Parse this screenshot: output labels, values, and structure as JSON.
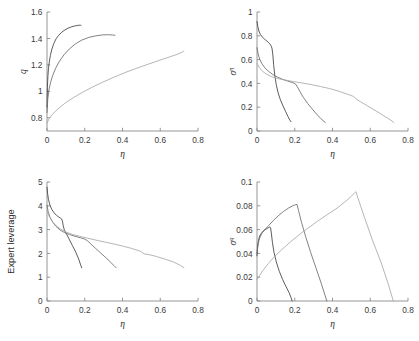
{
  "figure": {
    "background": "#ffffff",
    "panel_count": 4,
    "shared_xlabel": "η"
  },
  "axis": {
    "color": "#8a8a8a",
    "tick_font_size": "8.3px"
  },
  "series_colors": [
    "#3f3f3f",
    "#6b6b6b",
    "#a8a8a8"
  ],
  "chart_data": [
    {
      "id": "panel-tl",
      "type": "line",
      "title": "",
      "xlabel": "η",
      "ylabel": "q",
      "ylabel_sup": "",
      "xlim": [
        0,
        0.8
      ],
      "ylim": [
        0.7,
        1.6
      ],
      "xticks": [
        0,
        0.2,
        0.4,
        0.6,
        0.8
      ],
      "xticklabels": [
        "0",
        "0.2",
        "0.4",
        "0.6",
        "0.8"
      ],
      "yticks": [
        0.8,
        1,
        1.2,
        1.4,
        1.6
      ],
      "yticklabels": [
        "0.8",
        "1",
        "1.2",
        "1.4",
        "1.6"
      ],
      "grid": false,
      "legend": "none",
      "series": [
        {
          "name": "curve-1",
          "color": "#3f3f3f",
          "x": [
            0.0,
            0.002,
            0.005,
            0.008,
            0.012,
            0.018,
            0.026,
            0.036,
            0.048,
            0.062,
            0.078,
            0.095,
            0.112,
            0.13,
            0.146,
            0.16,
            0.17,
            0.176,
            0.18
          ],
          "y": [
            0.88,
            1.03,
            1.12,
            1.175,
            1.222,
            1.272,
            1.32,
            1.362,
            1.397,
            1.424,
            1.447,
            1.464,
            1.478,
            1.488,
            1.494,
            1.498,
            1.5,
            1.5,
            1.499
          ]
        },
        {
          "name": "curve-2",
          "color": "#6b6b6b",
          "x": [
            0.0,
            0.004,
            0.01,
            0.018,
            0.03,
            0.046,
            0.066,
            0.09,
            0.118,
            0.15,
            0.185,
            0.222,
            0.26,
            0.296,
            0.326,
            0.348,
            0.36
          ],
          "y": [
            0.84,
            0.94,
            1.01,
            1.062,
            1.12,
            1.175,
            1.228,
            1.276,
            1.32,
            1.358,
            1.388,
            1.408,
            1.42,
            1.427,
            1.428,
            1.426,
            1.424
          ]
        },
        {
          "name": "curve-3",
          "color": "#a8a8a8",
          "x": [
            0.0,
            0.01,
            0.025,
            0.045,
            0.07,
            0.1,
            0.14,
            0.185,
            0.235,
            0.29,
            0.35,
            0.41,
            0.47,
            0.53,
            0.59,
            0.645,
            0.69,
            0.715,
            0.725
          ],
          "y": [
            0.758,
            0.79,
            0.82,
            0.85,
            0.882,
            0.915,
            0.952,
            0.99,
            1.028,
            1.066,
            1.104,
            1.14,
            1.172,
            1.202,
            1.232,
            1.258,
            1.28,
            1.295,
            1.305
          ]
        }
      ]
    },
    {
      "id": "panel-tr",
      "type": "line",
      "title": "",
      "xlabel": "η",
      "ylabel": "σ",
      "ylabel_sup": "η",
      "xlim": [
        0,
        0.8
      ],
      "ylim": [
        0,
        1
      ],
      "xticks": [
        0,
        0.2,
        0.4,
        0.6,
        0.8
      ],
      "xticklabels": [
        "0",
        "0.2",
        "0.4",
        "0.6",
        "0.8"
      ],
      "yticks": [
        0,
        0.2,
        0.4,
        0.6,
        0.8,
        1
      ],
      "yticklabels": [
        "0",
        "0.2",
        "0.4",
        "0.6",
        "0.8",
        "1"
      ],
      "grid": false,
      "legend": "none",
      "series": [
        {
          "name": "curve-1",
          "color": "#3f3f3f",
          "x": [
            0.0,
            0.004,
            0.01,
            0.018,
            0.028,
            0.04,
            0.052,
            0.062,
            0.07,
            0.076,
            0.08,
            0.084,
            0.088,
            0.094,
            0.102,
            0.112,
            0.124,
            0.138,
            0.152,
            0.164,
            0.174,
            0.18
          ],
          "y": [
            0.92,
            0.88,
            0.84,
            0.812,
            0.79,
            0.772,
            0.756,
            0.742,
            0.728,
            0.712,
            0.69,
            0.64,
            0.56,
            0.47,
            0.39,
            0.32,
            0.262,
            0.21,
            0.162,
            0.122,
            0.092,
            0.078
          ]
        },
        {
          "name": "curve-2",
          "color": "#6b6b6b",
          "x": [
            0.0,
            0.006,
            0.014,
            0.026,
            0.042,
            0.062,
            0.086,
            0.11,
            0.136,
            0.162,
            0.186,
            0.202,
            0.214,
            0.228,
            0.246,
            0.268,
            0.292,
            0.316,
            0.338,
            0.354,
            0.362
          ],
          "y": [
            0.7,
            0.648,
            0.604,
            0.566,
            0.53,
            0.5,
            0.472,
            0.452,
            0.434,
            0.42,
            0.408,
            0.398,
            0.372,
            0.33,
            0.282,
            0.232,
            0.186,
            0.142,
            0.104,
            0.082,
            0.072
          ]
        },
        {
          "name": "curve-3",
          "color": "#a8a8a8",
          "x": [
            0.0,
            0.012,
            0.028,
            0.05,
            0.078,
            0.112,
            0.15,
            0.192,
            0.238,
            0.286,
            0.336,
            0.386,
            0.434,
            0.478,
            0.512,
            0.528,
            0.548,
            0.578,
            0.612,
            0.648,
            0.682,
            0.71,
            0.725
          ],
          "y": [
            0.57,
            0.534,
            0.504,
            0.478,
            0.456,
            0.44,
            0.428,
            0.416,
            0.404,
            0.39,
            0.374,
            0.356,
            0.334,
            0.31,
            0.29,
            0.266,
            0.246,
            0.218,
            0.186,
            0.152,
            0.118,
            0.09,
            0.072
          ]
        }
      ]
    },
    {
      "id": "panel-bl",
      "type": "line",
      "title": "",
      "xlabel": "η",
      "ylabel": "Expert leverage",
      "ylabel_sup": "",
      "xlim": [
        0,
        0.8
      ],
      "ylim": [
        0,
        5
      ],
      "xticks": [
        0,
        0.2,
        0.4,
        0.6,
        0.8
      ],
      "xticklabels": [
        "0",
        "0.2",
        "0.4",
        "0.6",
        "0.8"
      ],
      "yticks": [
        0,
        1,
        2,
        3,
        4,
        5
      ],
      "yticklabels": [
        "0",
        "1",
        "2",
        "3",
        "4",
        "5"
      ],
      "grid": false,
      "legend": "none",
      "series": [
        {
          "name": "curve-1",
          "color": "#3f3f3f",
          "x": [
            0.0,
            0.003,
            0.008,
            0.016,
            0.026,
            0.038,
            0.05,
            0.062,
            0.072,
            0.078,
            0.082,
            0.086,
            0.092,
            0.102,
            0.116,
            0.134,
            0.152,
            0.168,
            0.178,
            0.184
          ],
          "y": [
            4.78,
            4.52,
            4.26,
            4.02,
            3.84,
            3.7,
            3.6,
            3.53,
            3.48,
            3.44,
            3.35,
            3.16,
            2.98,
            2.84,
            2.62,
            2.34,
            2.06,
            1.76,
            1.52,
            1.4
          ]
        },
        {
          "name": "curve-2",
          "color": "#6b6b6b",
          "x": [
            0.0,
            0.006,
            0.016,
            0.03,
            0.048,
            0.07,
            0.094,
            0.12,
            0.148,
            0.176,
            0.2,
            0.216,
            0.232,
            0.256,
            0.284,
            0.312,
            0.338,
            0.356,
            0.366
          ],
          "y": [
            4.02,
            3.76,
            3.52,
            3.32,
            3.13,
            2.98,
            2.87,
            2.79,
            2.72,
            2.66,
            2.6,
            2.52,
            2.4,
            2.22,
            2.02,
            1.82,
            1.62,
            1.48,
            1.4
          ]
        },
        {
          "name": "curve-3",
          "color": "#a8a8a8",
          "x": [
            0.0,
            0.01,
            0.026,
            0.046,
            0.072,
            0.1,
            0.134,
            0.172,
            0.214,
            0.258,
            0.304,
            0.352,
            0.4,
            0.448,
            0.492,
            0.516,
            0.54,
            0.58,
            0.625,
            0.67,
            0.706,
            0.725
          ],
          "y": [
            3.82,
            3.58,
            3.36,
            3.18,
            3.02,
            2.9,
            2.8,
            2.72,
            2.64,
            2.56,
            2.48,
            2.4,
            2.31,
            2.21,
            2.1,
            1.98,
            1.95,
            1.87,
            1.76,
            1.64,
            1.5,
            1.4
          ]
        }
      ]
    },
    {
      "id": "panel-br",
      "type": "line",
      "title": "",
      "xlabel": "η",
      "ylabel": "σ",
      "ylabel_sup": "q",
      "xlim": [
        0,
        0.8
      ],
      "ylim": [
        0,
        0.1
      ],
      "xticks": [
        0,
        0.2,
        0.4,
        0.6,
        0.8
      ],
      "xticklabels": [
        "0",
        "0.2",
        "0.4",
        "0.6",
        "0.8"
      ],
      "yticks": [
        0,
        0.02,
        0.04,
        0.06,
        0.08,
        0.1
      ],
      "yticklabels": [
        "0",
        "0.02",
        "0.04",
        "0.06",
        "0.08",
        "0.1"
      ],
      "grid": false,
      "legend": "none",
      "series": [
        {
          "name": "curve-1",
          "color": "#3f3f3f",
          "x": [
            0.0,
            0.003,
            0.008,
            0.015,
            0.024,
            0.034,
            0.044,
            0.054,
            0.062,
            0.068,
            0.072,
            0.076,
            0.082,
            0.09,
            0.102,
            0.118,
            0.136,
            0.154,
            0.17,
            0.18,
            0.186
          ],
          "y": [
            0.038,
            0.046,
            0.051,
            0.055,
            0.057,
            0.059,
            0.06,
            0.061,
            0.0618,
            0.0622,
            0.0615,
            0.057,
            0.049,
            0.041,
            0.033,
            0.025,
            0.018,
            0.012,
            0.007,
            0.003,
            0.0
          ]
        },
        {
          "name": "curve-2",
          "color": "#6b6b6b",
          "x": [
            0.0,
            0.006,
            0.014,
            0.026,
            0.042,
            0.062,
            0.086,
            0.112,
            0.14,
            0.168,
            0.192,
            0.206,
            0.212,
            0.22,
            0.236,
            0.258,
            0.284,
            0.312,
            0.34,
            0.36,
            0.37
          ],
          "y": [
            0.04,
            0.048,
            0.053,
            0.057,
            0.06,
            0.0635,
            0.0675,
            0.0715,
            0.0752,
            0.0782,
            0.0802,
            0.081,
            0.0812,
            0.076,
            0.066,
            0.054,
            0.041,
            0.028,
            0.015,
            0.005,
            0.0
          ]
        },
        {
          "name": "curve-3",
          "color": "#a8a8a8",
          "x": [
            0.0,
            0.014,
            0.034,
            0.06,
            0.092,
            0.13,
            0.172,
            0.218,
            0.268,
            0.32,
            0.372,
            0.424,
            0.47,
            0.5,
            0.516,
            0.524,
            0.54,
            0.57,
            0.612,
            0.656,
            0.696,
            0.722
          ],
          "y": [
            0.018,
            0.0215,
            0.0262,
            0.0315,
            0.0372,
            0.043,
            0.049,
            0.055,
            0.061,
            0.067,
            0.0726,
            0.078,
            0.0838,
            0.088,
            0.0908,
            0.0918,
            0.084,
            0.07,
            0.051,
            0.033,
            0.014,
            0.0
          ]
        }
      ]
    }
  ]
}
